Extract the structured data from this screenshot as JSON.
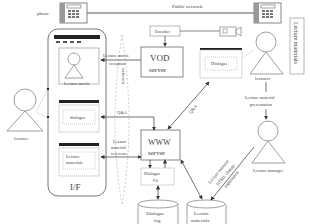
{
  "diagram": {
    "labels": {
      "phone": "phone",
      "public_network": "Public network",
      "encoder": "Encoder",
      "vod_server_line1": "VOD",
      "vod_server_line2": "server",
      "www_server_line1": "WWW",
      "www_server_line2": "server",
      "dialogue_window": "Dialogue",
      "lecturer": "lecturer",
      "learner": "learner",
      "lecture_materials_side": "Lecture materials",
      "lecture_material_presentation_line1": "Lecture material",
      "lecture_material_presentation_line2": "presentation",
      "lecture_manager": "Lecture manager",
      "lecture_movie": "Lecture movie",
      "if_dialogue": "dialogue",
      "if_materials_line1": "Lecture",
      "if_materials_line2": "materials",
      "if_label": "I/F",
      "lecture_movie_reception_line1": "Lecture movie",
      "lecture_movie_reception_line2": "reception",
      "network": "network",
      "qa_left": "Q&A",
      "qa_diag": "Q&A",
      "lecture_material_reference_line1": "Lecture",
      "lecture_material_reference_line2": "material",
      "lecture_material_reference_line3": "reference",
      "dialogue_fit_line1": "Dialogue",
      "dialogue_fit_line2": "Fit",
      "dialogue_log_line1": "Dialogue",
      "dialogue_log_line2": "log",
      "lecture_materials_db_line1": "Lecture",
      "lecture_materials_db_line2": "materials",
      "html_change_line1": "Lecture material",
      "html_change_line2": "HTML change",
      "html_change_line3": "registration"
    }
  }
}
